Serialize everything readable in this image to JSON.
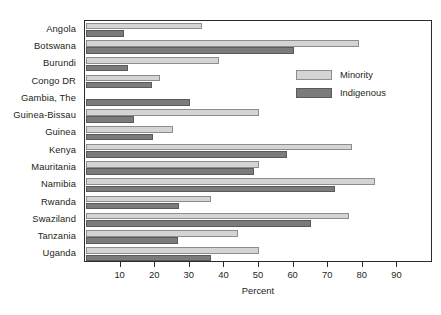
{
  "chart_data": {
    "type": "bar",
    "orientation": "horizontal",
    "title": "",
    "xlabel": "Percent",
    "ylabel": "",
    "xlim": [
      0,
      100
    ],
    "xticks": [
      10,
      20,
      30,
      40,
      50,
      60,
      70,
      80,
      90
    ],
    "grid": false,
    "legend_position": "inside-upper-right",
    "categories": [
      "Angola",
      "Botswana",
      "Burundi",
      "Congo DR",
      "Gambia, The",
      "Guinea-Bissau",
      "Guinea",
      "Kenya",
      "Mauritania",
      "Namibia",
      "Rwanda",
      "Swaziland",
      "Tanzania",
      "Uganda"
    ],
    "series": [
      {
        "name": "Minority",
        "color": "#d4d4d4",
        "values": [
          33.5,
          79,
          38.5,
          21.5,
          0,
          50,
          25,
          77,
          50,
          83.5,
          36,
          76,
          44,
          50
        ]
      },
      {
        "name": "Indigenous",
        "color": "#7b7b7b",
        "values": [
          11,
          60,
          12,
          19,
          30,
          14,
          19.5,
          58,
          48.5,
          72,
          27,
          65,
          26.5,
          36
        ]
      }
    ]
  },
  "legend": {
    "items": [
      {
        "label": "Minority"
      },
      {
        "label": "Indigenous"
      }
    ]
  },
  "axis": {
    "x_title": "Percent"
  }
}
